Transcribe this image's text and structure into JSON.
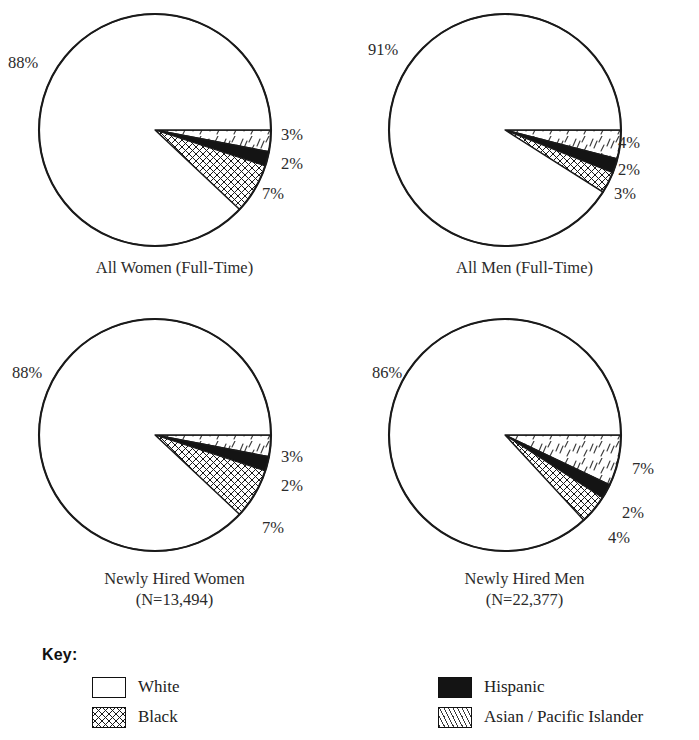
{
  "chart_data": [
    {
      "type": "pie",
      "title": "All Women (Full-Time)",
      "subtitle": "",
      "categories": [
        "Asian / Pacific Islander",
        "Hispanic",
        "Black",
        "White"
      ],
      "values": [
        3,
        2,
        7,
        88
      ],
      "value_labels": [
        "3%",
        "2%",
        "7%",
        "88%"
      ],
      "patterns": [
        "asian-dashes",
        "hispanic-solid",
        "black-xhatch",
        "white"
      ],
      "start_angle_deg": 0,
      "direction": "clockwise",
      "units": "percent"
    },
    {
      "type": "pie",
      "title": "All Men (Full-Time)",
      "subtitle": "",
      "categories": [
        "Asian / Pacific Islander",
        "Hispanic",
        "Black",
        "White"
      ],
      "values": [
        4,
        2,
        3,
        91
      ],
      "value_labels": [
        "4%",
        "2%",
        "3%",
        "91%"
      ],
      "patterns": [
        "asian-dashes",
        "hispanic-solid",
        "black-xhatch",
        "white"
      ],
      "start_angle_deg": 0,
      "direction": "clockwise",
      "units": "percent"
    },
    {
      "type": "pie",
      "title": "Newly Hired Women",
      "subtitle": "(N=13,494)",
      "categories": [
        "Asian / Pacific Islander",
        "Hispanic",
        "Black",
        "White"
      ],
      "values": [
        3,
        2,
        7,
        88
      ],
      "value_labels": [
        "3%",
        "2%",
        "7%",
        "88%"
      ],
      "patterns": [
        "asian-dashes",
        "hispanic-solid",
        "black-xhatch",
        "white"
      ],
      "start_angle_deg": 0,
      "direction": "clockwise",
      "units": "percent"
    },
    {
      "type": "pie",
      "title": "Newly Hired Men",
      "subtitle": "(N=22,377)",
      "categories": [
        "Asian / Pacific Islander",
        "Hispanic",
        "Black",
        "White"
      ],
      "values": [
        7,
        2,
        4,
        86
      ],
      "value_labels": [
        "7%",
        "2%",
        "4%",
        "86%"
      ],
      "patterns": [
        "asian-dashes",
        "hispanic-solid",
        "black-xhatch",
        "white"
      ],
      "start_angle_deg": 0,
      "direction": "clockwise",
      "units": "percent"
    }
  ],
  "charts": [
    {
      "caption": "All Women (Full-Time)",
      "caption_sub": "",
      "labels": {
        "major": "88%",
        "asian": "3%",
        "hispanic": "2%",
        "black": "7%"
      }
    },
    {
      "caption": "All Men (Full-Time)",
      "caption_sub": "",
      "labels": {
        "major": "91%",
        "asian": "4%",
        "hispanic": "2%",
        "black": "3%"
      }
    },
    {
      "caption": "Newly Hired Women",
      "caption_sub": "(N=13,494)",
      "labels": {
        "major": "88%",
        "asian": "3%",
        "hispanic": "2%",
        "black": "7%"
      }
    },
    {
      "caption": "Newly Hired Men",
      "caption_sub": "(N=22,377)",
      "labels": {
        "major": "86%",
        "asian": "7%",
        "hispanic": "2%",
        "black": "4%"
      }
    }
  ],
  "legend": {
    "title": "Key:",
    "left_items": [
      {
        "label": "White",
        "pattern": "white"
      },
      {
        "label": "Black",
        "pattern": "black-xhatch"
      }
    ],
    "right_items": [
      {
        "label": "Hispanic",
        "pattern": "hispanic-solid"
      },
      {
        "label": "Asian / Pacific Islander",
        "pattern": "asian-dashes"
      }
    ]
  },
  "colors": {
    "ink": "#1a1a1a",
    "paper": "#ffffff",
    "solid_fill": "#141414"
  }
}
